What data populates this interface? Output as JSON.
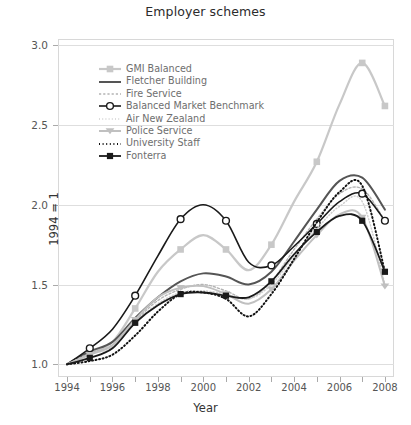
{
  "chart_data": {
    "type": "line",
    "title": "Employer schemes",
    "xlabel": "Year",
    "ylabel": "1994 = 1",
    "xlim": [
      1993.6,
      2008.4
    ],
    "ylim": [
      0.92,
      3.04
    ],
    "yticks": [
      1.0,
      1.5,
      2.0,
      2.5,
      3.0
    ],
    "ytick_labels": [
      "1.0",
      "1.5",
      "2.0",
      "2.5",
      "3.0"
    ],
    "xticks": [
      1994,
      1996,
      1998,
      2000,
      2002,
      2004,
      2006,
      2008
    ],
    "xtick_labels": [
      "1994",
      "1996",
      "1998",
      "2000",
      "2002",
      "2004",
      "2006",
      "2008"
    ],
    "grid": "horizontal",
    "legend_position": "upper-left-inside",
    "x": [
      1994,
      1995,
      1996,
      1997,
      1998,
      1999,
      2000,
      2001,
      2002,
      2003,
      2004,
      2005,
      2006,
      2007,
      2008
    ],
    "series": [
      {
        "name": "GMI Balanced",
        "color": "#c8c8c8",
        "style": "solid-marker",
        "marker": "square",
        "width": 2.2,
        "values": [
          1.0,
          1.07,
          1.14,
          1.35,
          1.58,
          1.72,
          1.81,
          1.72,
          1.59,
          1.75,
          2.02,
          2.27,
          2.63,
          2.89,
          2.62
        ]
      },
      {
        "name": "Fletcher Building",
        "color": "#555555",
        "style": "solid",
        "marker": "none",
        "width": 2.0,
        "values": [
          1.0,
          1.08,
          1.14,
          1.29,
          1.42,
          1.52,
          1.57,
          1.55,
          1.5,
          1.58,
          1.77,
          1.97,
          2.15,
          2.17,
          1.97
        ]
      },
      {
        "name": "Fire Service",
        "color": "#b4b4b4",
        "style": "dashed-fine",
        "marker": "none",
        "width": 1.4,
        "values": [
          1.0,
          1.07,
          1.12,
          1.27,
          1.4,
          1.47,
          1.5,
          1.46,
          1.41,
          1.52,
          1.72,
          1.91,
          2.07,
          2.1,
          1.9
        ]
      },
      {
        "name": "Balanced Market Benchmark",
        "color": "#1a1a1a",
        "style": "solid-marker",
        "marker": "circle-open",
        "width": 1.6,
        "values": [
          1.0,
          1.1,
          1.22,
          1.43,
          1.68,
          1.91,
          2.0,
          1.9,
          1.64,
          1.62,
          1.74,
          1.88,
          2.02,
          2.07,
          1.9
        ]
      },
      {
        "name": "Air New Zealand",
        "color": "#d0d0d0",
        "style": "dotted-fine",
        "marker": "none",
        "width": 1.5,
        "values": [
          1.0,
          1.06,
          1.11,
          1.26,
          1.38,
          1.45,
          1.46,
          1.44,
          1.41,
          1.5,
          1.68,
          1.85,
          1.99,
          2.02,
          1.5
        ]
      },
      {
        "name": "Police Service",
        "color": "#c0c0c0",
        "style": "solid-marker",
        "marker": "triangle",
        "width": 2.0,
        "values": [
          1.0,
          1.06,
          1.12,
          1.28,
          1.42,
          1.48,
          1.49,
          1.44,
          1.38,
          1.47,
          1.65,
          1.81,
          1.94,
          1.92,
          1.49
        ]
      },
      {
        "name": "University Staff",
        "color": "#111111",
        "style": "dotted",
        "marker": "none",
        "width": 2.0,
        "values": [
          1.0,
          1.02,
          1.06,
          1.18,
          1.33,
          1.44,
          1.45,
          1.41,
          1.3,
          1.44,
          1.66,
          1.89,
          2.08,
          2.12,
          1.58
        ]
      },
      {
        "name": "Fonterra",
        "color": "#1a1a1a",
        "style": "solid-marker",
        "marker": "square-filled",
        "width": 1.8,
        "values": [
          1.0,
          1.04,
          1.1,
          1.26,
          1.37,
          1.44,
          1.45,
          1.43,
          1.42,
          1.52,
          1.69,
          1.83,
          1.93,
          1.9,
          1.58
        ]
      }
    ]
  }
}
